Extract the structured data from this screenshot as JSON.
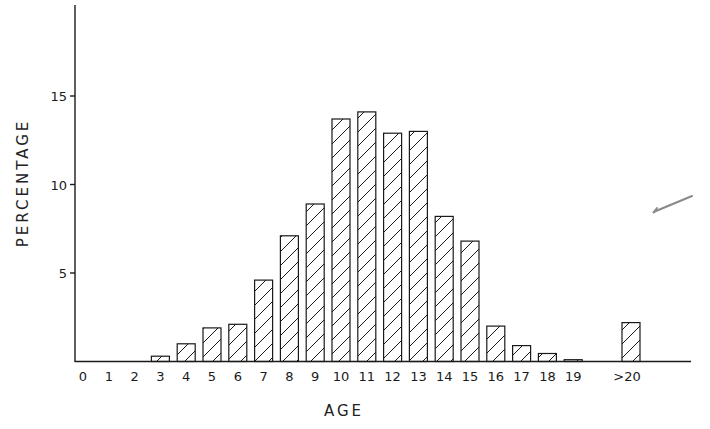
{
  "chart_data": {
    "type": "bar",
    "title": "",
    "xlabel": "AGE",
    "ylabel": "PERCENTAGE",
    "categories": [
      "0",
      "1",
      "2",
      "3",
      "4",
      "5",
      "6",
      "7",
      "8",
      "9",
      "10",
      "11",
      "12",
      "13",
      "14",
      "15",
      "16",
      "17",
      "18",
      "19",
      ">20"
    ],
    "values": [
      0,
      0,
      0,
      0.3,
      1.0,
      1.9,
      2.1,
      4.6,
      7.1,
      8.9,
      13.7,
      14.1,
      12.9,
      13.0,
      8.2,
      6.8,
      2.0,
      0.9,
      0.45,
      0.1,
      2.2
    ],
    "yticks": [
      5,
      10,
      15
    ],
    "ylim": [
      0,
      20
    ],
    "grid": false,
    "legend": null,
    "bar_fill": "diagonal-hatch",
    "annotations": [
      "hand-drawn pen check mark at right margin"
    ]
  },
  "colors": {
    "ink": "#1a1a1a",
    "background": "#ffffff",
    "pen_mark": "#8a8a8a"
  }
}
